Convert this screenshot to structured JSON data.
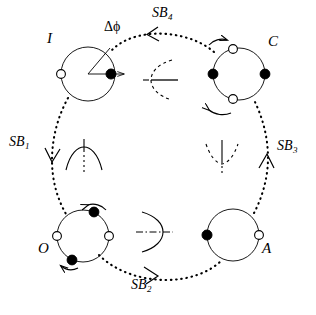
{
  "figure": {
    "type": "cycle-diagram",
    "background_color": "#ffffff",
    "stroke_color": "#000000"
  },
  "states": [
    {
      "id": "I",
      "label": "I",
      "label_x": 47,
      "label_y": 37,
      "center_x": 88,
      "center_y": 74,
      "radius": 27,
      "dots": [
        {
          "kind": "open",
          "angle_deg": 180,
          "radius_frac": 1.0
        },
        {
          "kind": "filled",
          "angle_deg": 0,
          "radius_frac": 0.86
        }
      ],
      "has_phase_arrow": true,
      "has_phase_wedge": true
    },
    {
      "id": "C",
      "label": "C",
      "label_x": 268,
      "label_y": 40,
      "center_x": 239,
      "center_y": 74,
      "radius": 26,
      "dots": [
        {
          "kind": "filled",
          "angle_deg": 180,
          "radius_frac": 1.0
        },
        {
          "kind": "filled",
          "angle_deg": 0,
          "radius_frac": 1.0
        },
        {
          "kind": "open",
          "angle_deg": 104,
          "radius_frac": 1.0
        },
        {
          "kind": "open",
          "angle_deg": 256,
          "radius_frac": 1.0
        }
      ],
      "has_phase_arrow": false,
      "has_phase_wedge": false
    },
    {
      "id": "A",
      "label": "A",
      "label_x": 262,
      "label_y": 247,
      "center_x": 233,
      "center_y": 235,
      "radius": 26,
      "dots": [
        {
          "kind": "filled",
          "angle_deg": 180,
          "radius_frac": 1.0
        },
        {
          "kind": "open",
          "angle_deg": 0,
          "radius_frac": 1.0
        }
      ],
      "has_phase_arrow": false,
      "has_phase_wedge": false
    },
    {
      "id": "O",
      "label": "O",
      "label_x": 38,
      "label_y": 247,
      "center_x": 83,
      "center_y": 236,
      "radius": 26,
      "dots": [
        {
          "kind": "open",
          "angle_deg": 180,
          "radius_frac": 1.0
        },
        {
          "kind": "open",
          "angle_deg": 0,
          "radius_frac": 1.0
        },
        {
          "kind": "filled",
          "angle_deg": 66,
          "radius_frac": 1.0
        },
        {
          "kind": "filled",
          "angle_deg": 246,
          "radius_frac": 1.0
        }
      ],
      "has_phase_arrow": false,
      "has_phase_wedge": false
    }
  ],
  "transitions": [
    {
      "id": "SB1",
      "label": "SB",
      "subscript": "1",
      "label_x": 9,
      "label_y": 142,
      "from": "I",
      "to": "O",
      "arrow_direction": "down"
    },
    {
      "id": "SB2",
      "label": "SB",
      "subscript": "2",
      "label_x": 131,
      "label_y": 285,
      "from": "O",
      "to": "A",
      "arrow_direction": "right"
    },
    {
      "id": "SB3",
      "label": "SB",
      "subscript": "3",
      "label_x": 277,
      "label_y": 146,
      "from": "A",
      "to": "C",
      "arrow_direction": "up"
    },
    {
      "id": "SB4",
      "label": "SB",
      "subscript": "4",
      "label_x": 152,
      "label_y": 12,
      "label_x2": 0,
      "from": "C",
      "to": "I",
      "arrow_direction": "left"
    }
  ],
  "annotations": [
    {
      "id": "delta-phi",
      "text": "Δϕ",
      "x": 104,
      "y": 26
    }
  ],
  "center_symbols": [
    {
      "id": "top-bracket",
      "kind": "dashed-arc-left-open",
      "x": 164,
      "y": 80,
      "note": "dashed arc opening left with solid horizontal axis"
    },
    {
      "id": "left-dome",
      "kind": "solid-arc-dome",
      "x": 83,
      "y": 160,
      "note": "downward-opening arc with vertical axis, upper half solid"
    },
    {
      "id": "right-valley",
      "kind": "dashed-arc-valley",
      "x": 222,
      "y": 160,
      "note": "upward-opening dashed arc with vertical axis"
    },
    {
      "id": "bottom-bracket",
      "kind": "solid-arc-right-open",
      "x": 155,
      "y": 232,
      "note": "solid arc opening left with dash-dot horizontal axis"
    }
  ]
}
